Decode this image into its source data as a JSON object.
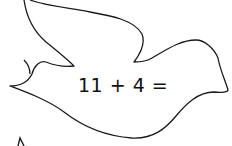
{
  "worksheet": {
    "shape": "dove",
    "equation": "11 + 4 =",
    "answer": "",
    "outline_color": "#1a1a1a"
  }
}
